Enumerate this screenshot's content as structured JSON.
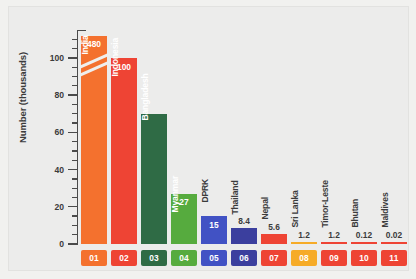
{
  "chart_data": {
    "type": "bar",
    "title": "",
    "subtitle": "",
    "xlabel": "",
    "ylabel": "Number (thousands)",
    "ylim": [
      0,
      115
    ],
    "axis_break": true,
    "axis_break_note": "India bar is truncated; true value 480 shown above break marks",
    "grid": false,
    "legend": "none",
    "ytick_labels": [
      "0",
      "20",
      "40",
      "60",
      "80",
      "100"
    ],
    "ytick_values": [
      0,
      20,
      40,
      60,
      80,
      100
    ],
    "minor_ticks": true,
    "categories": [
      "India",
      "Indonesia",
      "Bangladesh",
      "Myanmar",
      "DPRK",
      "Thailand",
      "Nepal",
      "Sri Lanka",
      "Timor-Leste",
      "Bhutan",
      "Maldives"
    ],
    "values": [
      480,
      100,
      70,
      27,
      15,
      8.4,
      5.6,
      1.2,
      1.2,
      0.12,
      0.02
    ],
    "value_labels": [
      "480",
      "100",
      "",
      "27",
      "15",
      "8.4",
      "5.6",
      "1.2",
      "1.2",
      "0.12",
      "0.02"
    ],
    "index_labels": [
      "01",
      "02",
      "03",
      "04",
      "05",
      "06",
      "07",
      "08",
      "09",
      "10",
      "11"
    ],
    "colors": [
      "#f4712e",
      "#ee4434",
      "#2f6b45",
      "#56ab3e",
      "#4152c4",
      "#3b3f9e",
      "#ee4434",
      "#f6ab27",
      "#ee4434",
      "#ee4434",
      "#ee4434"
    ],
    "label_placement": [
      "inside",
      "inside",
      "inside",
      "inside",
      "inside",
      "outside",
      "outside",
      "outside",
      "outside",
      "outside",
      "outside"
    ],
    "name_placement": [
      "inside",
      "inside",
      "inside",
      "inside",
      "outside",
      "outside",
      "outside",
      "outside",
      "outside",
      "outside",
      "outside"
    ]
  },
  "style": {
    "background": "#ececeb",
    "axis_color": "#4a4a4a",
    "text_color": "#3b3b3b"
  }
}
